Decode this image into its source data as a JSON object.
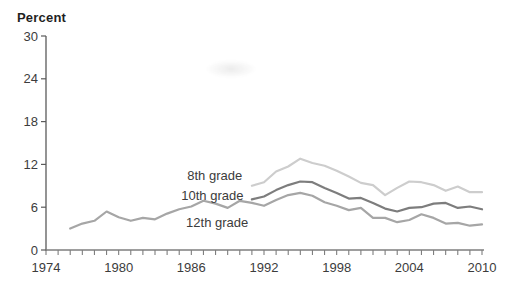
{
  "figure": {
    "ylabel": "Percent"
  },
  "chart_data": {
    "type": "line",
    "title": "",
    "ylabel": "Percent",
    "xlabel": "",
    "ylim": [
      0,
      30
    ],
    "yticks": [
      0,
      6,
      12,
      18,
      24,
      30
    ],
    "xlim": [
      1974,
      2010
    ],
    "xtick_step": 1,
    "xtick_label_years": [
      1974,
      1980,
      1986,
      1992,
      1998,
      2004,
      2010
    ],
    "grid": false,
    "legend": "inline-annotations",
    "axis_color": "#5a5a5a",
    "tick_text_color": "#3c3c3c",
    "series": [
      {
        "name": "8th grade",
        "color": "#cdcdcd",
        "x_start": 1991,
        "values": [
          9.0,
          9.5,
          11.0,
          11.7,
          12.8,
          12.2,
          11.8,
          11.1,
          10.3,
          9.4,
          9.1,
          7.7,
          8.7,
          9.6,
          9.5,
          9.1,
          8.3,
          8.9,
          8.1,
          8.1
        ]
      },
      {
        "name": "10th grade",
        "color": "#7d7d7d",
        "x_start": 1991,
        "values": [
          7.1,
          7.5,
          8.4,
          9.1,
          9.6,
          9.5,
          8.7,
          8.0,
          7.2,
          7.3,
          6.6,
          5.8,
          5.4,
          5.9,
          6.0,
          6.5,
          6.6,
          5.9,
          6.1,
          5.7
        ]
      },
      {
        "name": "12th grade",
        "color": "#a6a6a6",
        "x_start": 1976,
        "values": [
          3.0,
          3.7,
          4.1,
          5.4,
          4.6,
          4.1,
          4.5,
          4.3,
          5.1,
          5.7,
          6.1,
          6.9,
          6.5,
          5.9,
          6.9,
          6.6,
          6.2,
          7.0,
          7.7,
          8.0,
          7.6,
          6.7,
          6.2,
          5.6,
          5.9,
          4.5,
          4.5,
          3.9,
          4.2,
          5.0,
          4.5,
          3.7,
          3.8,
          3.4,
          3.6
        ]
      }
    ],
    "annotations": [
      {
        "text": "8th grade",
        "year": 1990.2,
        "value": 10.4,
        "align": "end"
      },
      {
        "text": "10th grade",
        "year": 1990.3,
        "value": 7.6,
        "align": "end"
      },
      {
        "text": "12th grade",
        "year": 1990.7,
        "value": 3.8,
        "align": "end"
      }
    ]
  }
}
